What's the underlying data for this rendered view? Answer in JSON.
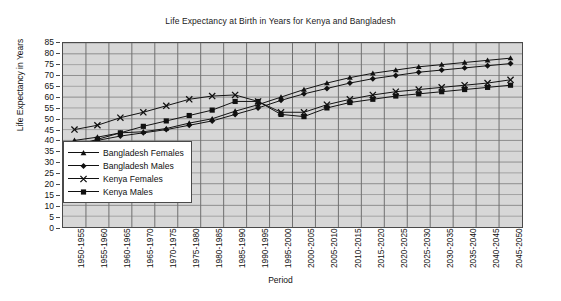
{
  "chart_data": {
    "type": "line",
    "title": "Life Expectancy at Birth in Years for Kenya and Bangladesh",
    "xlabel": "Period",
    "ylabel": "Life Expectancy in Years",
    "ylim": [
      0,
      85
    ],
    "ytick_step": 5,
    "yticks": [
      0,
      5,
      10,
      15,
      20,
      25,
      30,
      35,
      40,
      45,
      50,
      55,
      60,
      65,
      70,
      75,
      80,
      85
    ],
    "grid": true,
    "legend_position": "inside-left",
    "plot_background": "#d7d7d7",
    "line_color": "#111111",
    "categories": [
      "1950-1955",
      "1955-1960",
      "1960-1965",
      "1965-1970",
      "1970-1975",
      "1975-1980",
      "1980-1985",
      "1985-1990",
      "1990-1995",
      "1995-2000",
      "2000-2005",
      "2005-2010",
      "2010-2015",
      "2015-2020",
      "2020-2025",
      "2025-2030",
      "2030-2035",
      "2035-2040",
      "2040-2045",
      "2045-2050"
    ],
    "series": [
      {
        "name": "Bangladesh Females",
        "marker": "triangle",
        "values": [
          40.0,
          41.5,
          43.5,
          44.0,
          45.5,
          48.0,
          50.0,
          53.5,
          56.5,
          60.0,
          63.5,
          66.5,
          69.0,
          71.0,
          72.5,
          74.0,
          75.0,
          76.0,
          77.0,
          78.0
        ]
      },
      {
        "name": "Bangladesh Males",
        "marker": "diamond",
        "values": [
          38.0,
          40.0,
          42.0,
          43.5,
          45.0,
          47.0,
          49.0,
          52.0,
          55.0,
          58.5,
          61.5,
          64.0,
          66.5,
          68.5,
          70.0,
          71.5,
          72.5,
          73.5,
          74.5,
          75.5
        ]
      },
      {
        "name": "Kenya Females",
        "marker": "x",
        "values": [
          45.0,
          47.0,
          50.5,
          53.0,
          56.0,
          59.0,
          60.5,
          61.0,
          58.0,
          53.0,
          53.0,
          56.5,
          59.0,
          61.0,
          62.5,
          63.5,
          64.5,
          65.5,
          66.5,
          68.0
        ]
      },
      {
        "name": "Kenya Males",
        "marker": "square",
        "values": [
          37.5,
          40.5,
          43.5,
          46.5,
          49.0,
          51.5,
          54.0,
          58.0,
          58.0,
          52.0,
          51.0,
          55.0,
          57.5,
          59.0,
          60.5,
          61.5,
          62.5,
          63.5,
          64.5,
          65.5
        ]
      }
    ]
  }
}
